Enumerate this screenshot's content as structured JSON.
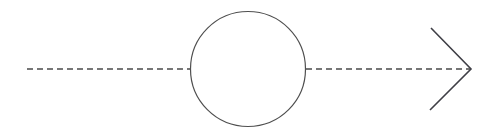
{
  "canvas": {
    "width": 493,
    "height": 133,
    "background_color": "#ffffff"
  },
  "diagram": {
    "type": "flow-arrow-with-node",
    "stroke_color": "#4a4a4a",
    "node_stroke_color": "#4f4f4f",
    "arrow_stroke_color": "#3f3f46",
    "elements": [
      {
        "id": "edge-left",
        "name": "incoming-dashed-edge",
        "shape": "dashed-line",
        "x1": 27,
        "y1": 69,
        "x2": 191,
        "y2": 69,
        "stroke_width": 1.4,
        "dash_pattern": "6 4"
      },
      {
        "id": "node-circle",
        "name": "circle-node",
        "shape": "circle",
        "cx": 248,
        "cy": 69,
        "r": 57.5,
        "stroke_width": 1.2,
        "fill": "none"
      },
      {
        "id": "edge-right",
        "name": "outgoing-dashed-edge",
        "shape": "dashed-line",
        "x1": 306,
        "y1": 69,
        "x2": 470,
        "y2": 69,
        "stroke_width": 1.4,
        "dash_pattern": "6 4"
      },
      {
        "id": "arrow-head",
        "name": "chevron-arrowhead",
        "shape": "open-chevron",
        "points": "431,28 471,69 430,110",
        "stroke_width": 1.6
      }
    ]
  },
  "labels": {
    "title": "",
    "annotations": []
  }
}
